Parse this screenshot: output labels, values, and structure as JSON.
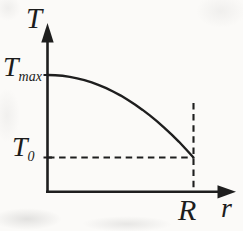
{
  "figure": {
    "labels": {
      "y_axis": "T",
      "x_axis": "r",
      "y_max_base": "T",
      "y_max_sub": "max",
      "y0_base": "T",
      "y0_sub": "0",
      "x_R": "R"
    },
    "colors": {
      "ink": "#1e1e1e",
      "paper": "#fbfaf8"
    }
  },
  "chart_data": {
    "type": "line",
    "title": "",
    "xlabel": "r",
    "ylabel": "T",
    "x_tick_labels": [
      "R"
    ],
    "y_tick_labels": [
      "T_max",
      "T_0"
    ],
    "axis_style": "arrowed axes, qualitative sketch (no numeric scale)",
    "grid": false,
    "legend": null,
    "annotations": [
      "horizontal dashed line at T = T_0 from T-axis to the point (R, T_0)",
      "vertical dashed line at r = R from above the curve endpoint down to the r-axis",
      "curve starts at (0, T_max) with zero slope and ends at (R, T_0)"
    ],
    "series": [
      {
        "name": "T(r) = T_0 + (T_max - T_0)(1 - (r/R)^2)",
        "x_over_R": [
          0,
          0.05,
          0.1,
          0.15,
          0.2,
          0.25,
          0.3,
          0.35,
          0.4,
          0.45,
          0.5,
          0.55,
          0.6,
          0.65,
          0.7,
          0.75,
          0.8,
          0.85,
          0.9,
          0.95,
          1
        ],
        "T_normalized": [
          1,
          0.9975,
          0.99,
          0.9775,
          0.96,
          0.9375,
          0.91,
          0.8775,
          0.84,
          0.7975,
          0.75,
          0.6975,
          0.64,
          0.5775,
          0.51,
          0.4375,
          0.36,
          0.2775,
          0.19,
          0.0975,
          0
        ]
      }
    ]
  }
}
